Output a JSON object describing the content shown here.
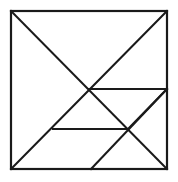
{
  "figure": {
    "kind": "line-diagram",
    "caption": "",
    "background_color": "#ffffff",
    "line_color": "#1a1a1a",
    "line_width": 2,
    "canvas": {
      "width": 178,
      "height": 182
    }
  },
  "geometry": {
    "square": {
      "left": 11,
      "top": 11,
      "right": 167,
      "bottom": 169,
      "label": "outer-square"
    },
    "points": {
      "top_left": [
        11,
        11
      ],
      "top_right": [
        167,
        11
      ],
      "bottom_left": [
        11,
        169
      ],
      "bottom_right": [
        167,
        169
      ],
      "center": [
        89,
        89
      ],
      "right_mid": [
        167,
        89
      ],
      "lower_left_vertex": [
        53,
        129
      ],
      "lower_right_vertex": [
        128,
        129
      ],
      "bottom_mid": [
        91,
        169
      ]
    },
    "segments": [
      {
        "name": "square-top-edge",
        "from": [
          11,
          11
        ],
        "to": [
          167,
          11
        ]
      },
      {
        "name": "square-right-edge",
        "from": [
          167,
          11
        ],
        "to": [
          167,
          169
        ]
      },
      {
        "name": "square-bottom-edge",
        "from": [
          167,
          169
        ],
        "to": [
          11,
          169
        ]
      },
      {
        "name": "square-left-edge",
        "from": [
          11,
          169
        ],
        "to": [
          11,
          11
        ]
      },
      {
        "name": "main-diagonal-tl-br",
        "from": [
          11,
          11
        ],
        "to": [
          167,
          169
        ]
      },
      {
        "name": "anti-diagonal-tr-bl",
        "from": [
          167,
          11
        ],
        "to": [
          11,
          169
        ]
      },
      {
        "name": "upper-horizontal-center-to-right",
        "from": [
          89,
          89
        ],
        "to": [
          167,
          89
        ]
      },
      {
        "name": "lower-horizontal",
        "from": [
          53,
          129
        ],
        "to": [
          128,
          129
        ]
      },
      {
        "name": "short-diagonal-lowerright-to-rightmid",
        "from": [
          128,
          129
        ],
        "to": [
          167,
          89
        ]
      },
      {
        "name": "long-diagonal-bottommid-to-rightmid",
        "from": [
          91,
          169
        ],
        "to": [
          167,
          89
        ]
      }
    ],
    "pieces": [
      {
        "name": "large-triangle-top",
        "vertices": [
          [
            11,
            11
          ],
          [
            167,
            11
          ],
          [
            89,
            89
          ]
        ]
      },
      {
        "name": "large-triangle-left",
        "vertices": [
          [
            11,
            11
          ],
          [
            89,
            89
          ],
          [
            11,
            169
          ]
        ]
      },
      {
        "name": "medium-triangle-center",
        "vertices": [
          [
            89,
            89
          ],
          [
            128,
            129
          ],
          [
            53,
            129
          ]
        ]
      },
      {
        "name": "small-triangle-upper-right",
        "vertices": [
          [
            89,
            89
          ],
          [
            167,
            89
          ],
          [
            128,
            129
          ]
        ]
      },
      {
        "name": "parallelogram-lower",
        "vertices": [
          [
            53,
            129
          ],
          [
            128,
            129
          ],
          [
            91,
            169
          ],
          [
            11,
            169
          ]
        ]
      },
      {
        "name": "triangle-lower-right",
        "vertices": [
          [
            128,
            129
          ],
          [
            167,
            89
          ],
          [
            167,
            169
          ],
          [
            91,
            169
          ]
        ]
      }
    ]
  }
}
